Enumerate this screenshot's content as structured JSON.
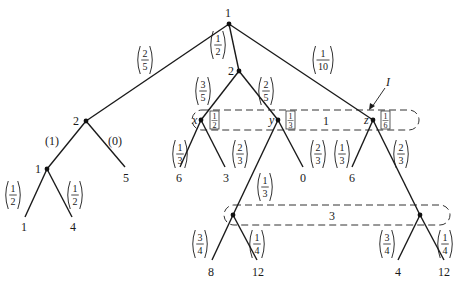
{
  "colors": {
    "ink": "#1a1a1a",
    "background": "#ffffff"
  },
  "nodes": {
    "root": {
      "player": "1"
    },
    "left": {
      "player": "2"
    },
    "left_child": {
      "player": "1"
    },
    "middle": {
      "player": "2"
    },
    "x": {
      "name": "x",
      "belief": [
        "1",
        "2"
      ]
    },
    "y": {
      "name": "y",
      "belief": [
        "1",
        "3"
      ]
    },
    "z": {
      "name": "z",
      "belief": [
        "1",
        "6"
      ]
    }
  },
  "info_sets": {
    "upper": {
      "player": "1",
      "label": "I"
    },
    "lower": {
      "player": "3"
    }
  },
  "edge_probs": {
    "root_left": [
      "2",
      "5"
    ],
    "root_middle": [
      "1",
      "2"
    ],
    "root_right": [
      "1",
      "10"
    ],
    "left_l": "(1)",
    "left_r": "(0)",
    "lc_l": [
      "1",
      "2"
    ],
    "lc_r": [
      "1",
      "2"
    ],
    "mid_x": [
      "3",
      "5"
    ],
    "mid_y": [
      "2",
      "5"
    ],
    "x_l": [
      "1",
      "3"
    ],
    "x_r": [
      "2",
      "3"
    ],
    "y_l": [
      "1",
      "3"
    ],
    "y_r": [
      "2",
      "3"
    ],
    "z_l": [
      "1",
      "3"
    ],
    "z_r": [
      "2",
      "3"
    ],
    "p_l": [
      "3",
      "4"
    ],
    "p_r": [
      "1",
      "4"
    ],
    "q_l": [
      "3",
      "4"
    ],
    "q_r": [
      "1",
      "4"
    ]
  },
  "payoffs": {
    "lc_l": "1",
    "lc_r": "4",
    "left_r": "5",
    "x_l": "6",
    "x_r": "3",
    "y_r": "0",
    "z_l": "6",
    "p_l": "8",
    "p_r": "12",
    "q_l": "4",
    "q_r": "12"
  }
}
